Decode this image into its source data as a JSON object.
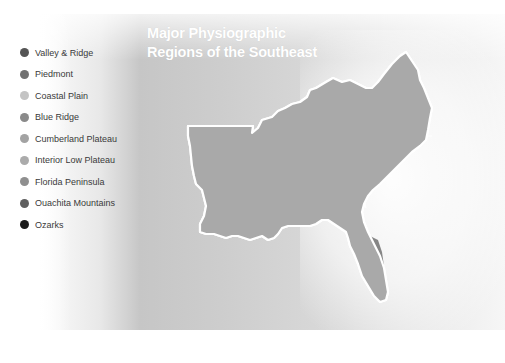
{
  "title": {
    "line1": "Major Physiographic",
    "line2": "Regions of the Southeast"
  },
  "legend": {
    "items": [
      {
        "label": "Valley & Ridge",
        "color": "#555555"
      },
      {
        "label": "Piedmont",
        "color": "#717171"
      },
      {
        "label": "Coastal Plain",
        "color": "#c4c4c4"
      },
      {
        "label": "Blue Ridge",
        "color": "#8a8a8a"
      },
      {
        "label": "Cumberland Plateau",
        "color": "#a3a3a3"
      },
      {
        "label": "Interior Low Plateau",
        "color": "#ababab"
      },
      {
        "label": "Florida Peninsula",
        "color": "#8f8f8f"
      },
      {
        "label": "Ouachita Mountains",
        "color": "#5f5f5f"
      },
      {
        "label": "Ozarks",
        "color": "#1c1c1c"
      }
    ]
  },
  "map": {
    "region_colors": {
      "coastal_plain": "#a9a9a9",
      "interior_low_plateau": "#999999",
      "cumberland_plateau": "#8c8c8c",
      "valley_ridge": "#5b5b5b",
      "blue_ridge": "#4a4a4a",
      "piedmont": "#7b7b7b",
      "florida": "#868686",
      "ouachita": "#5e5e5e",
      "ozarks": "#1e1e1e",
      "border": "#ffffff"
    }
  }
}
